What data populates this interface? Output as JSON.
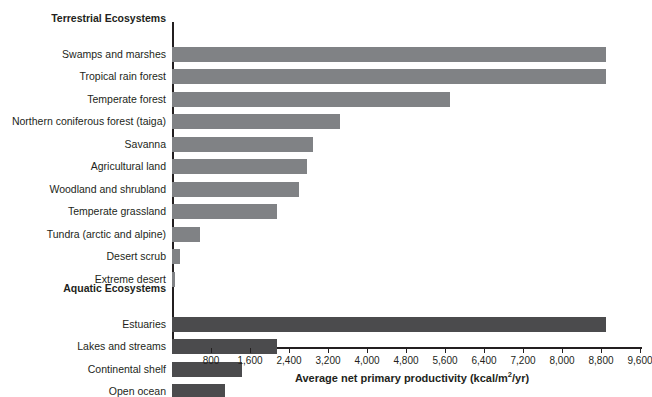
{
  "chart_data": {
    "type": "bar",
    "orientation": "horizontal",
    "title": "",
    "xlabel": "Average net primary productivity (kcal/m2/yr)",
    "ylabel": "",
    "xlim": [
      0,
      9600
    ],
    "xticks": [
      800,
      1600,
      2400,
      3200,
      4000,
      4800,
      5600,
      6400,
      7200,
      8000,
      8800,
      9600
    ],
    "xtick_labels": [
      "800",
      "1,600",
      "2,400",
      "3,200",
      "4,000",
      "4,800",
      "5,600",
      "6,400",
      "7,200",
      "8,000",
      "8,800",
      "9,600"
    ],
    "grid": false,
    "legend": "none",
    "groups": [
      {
        "name": "Terrestrial Ecosystems",
        "color": "#808285",
        "categories": [
          "Swamps and marshes",
          "Tropical rain forest",
          "Temperate forest",
          "Northern coniferous forest (taiga)",
          "Savanna",
          "Agricultural land",
          "Woodland and shrubland",
          "Temperate grassland",
          "Tundra (arctic and alpine)",
          "Desert scrub",
          "Extreme desert"
        ],
        "values": [
          8900,
          8900,
          5700,
          3450,
          2900,
          2770,
          2600,
          2150,
          575,
          160,
          60
        ]
      },
      {
        "name": "Aquatic Ecosystems",
        "color": "#4b4b4d",
        "categories": [
          "Estuaries",
          "Lakes and streams",
          "Continental shelf",
          "Open ocean"
        ],
        "values": [
          8900,
          2150,
          1440,
          1080
        ]
      }
    ]
  },
  "axis": {
    "title_prefix": "Average net primary productivity (kcal/m",
    "title_sup": "2",
    "title_suffix": "/yr)"
  },
  "colors": {
    "terrestrial_bar": "#808285",
    "aquatic_bar": "#4b4b4d",
    "axis": "#231f20",
    "text": "#231f20",
    "background": "#ffffff"
  }
}
